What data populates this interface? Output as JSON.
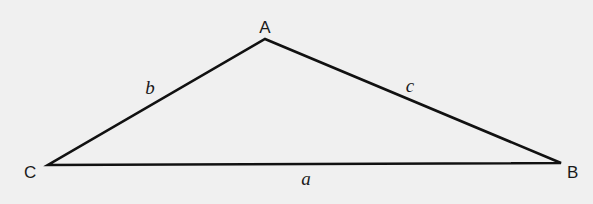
{
  "diagram": {
    "type": "triangle",
    "background_color": "#f0f0f0",
    "stroke_color": "#111111",
    "vertices": [
      {
        "id": "A",
        "label": "A",
        "x": 265,
        "y": 39
      },
      {
        "id": "B",
        "label": "B",
        "x": 561,
        "y": 163
      },
      {
        "id": "C",
        "label": "C",
        "x": 48,
        "y": 165
      }
    ],
    "sides": [
      {
        "id": "a",
        "label": "a",
        "between": [
          "B",
          "C"
        ]
      },
      {
        "id": "b",
        "label": "b",
        "between": [
          "A",
          "C"
        ]
      },
      {
        "id": "c",
        "label": "c",
        "between": [
          "A",
          "B"
        ]
      }
    ]
  }
}
